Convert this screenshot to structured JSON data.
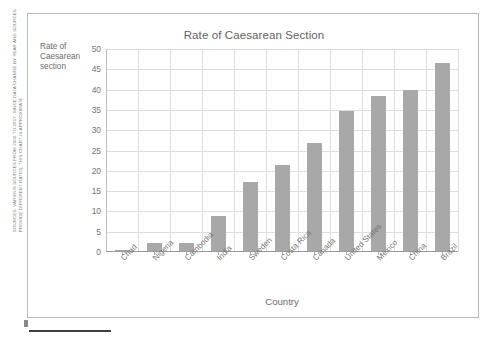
{
  "slide": {
    "source_note": "SOURCES: VARIOUS SOURCES FROM 2000 TO 2017. SINCE DATA CHANGE BY YEAR AND SOURCES PROVIDE DIFFERENT RATES, THIS CHART IS APPROXIMATE."
  },
  "y_axis_caption": {
    "line1": "Rate of",
    "line2": "Caesarean",
    "line3": "section"
  },
  "colors": {
    "bar": "#a8a8a8",
    "gridline": "#dedede",
    "axis": "#9a9a9a",
    "text": "#6e6e6e",
    "frame": "#b9b9b9",
    "rule": "#3d3d3d"
  },
  "chart_data": {
    "type": "bar",
    "title": "Rate of Caesarean Section",
    "xlabel": "Country",
    "ylabel": "Rate of Caesarean section",
    "categories": [
      "Chad",
      "Nigeria",
      "Cambodia",
      "India",
      "Sweden",
      "Costa Rica",
      "Canada",
      "United States",
      "Mexico",
      "China",
      "Brazil"
    ],
    "values": [
      0.3,
      2.0,
      2.0,
      8.7,
      17.1,
      21.1,
      26.5,
      34.4,
      38.2,
      39.7,
      46.2
    ],
    "ylim": [
      0,
      50
    ],
    "ytick_step": 5,
    "yticks": [
      0,
      5,
      10,
      15,
      20,
      25,
      30,
      35,
      40,
      45,
      50
    ],
    "grid": true,
    "legend": "none"
  }
}
